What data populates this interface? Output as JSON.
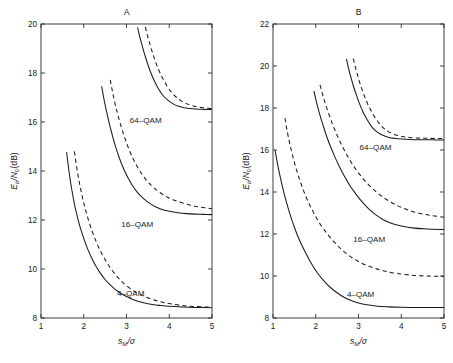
{
  "figure": {
    "width": 453,
    "height": 363,
    "background": "#ffffff",
    "ink_color": "#1a1a1a"
  },
  "chart_data": [
    {
      "type": "line",
      "title": "A",
      "panel_id": "A",
      "xlabel": "s_M/σ",
      "xlabel_parts": {
        "base": "s",
        "sub": "M",
        "tail": "/σ"
      },
      "ylabel": "E_b/N_0(dB)",
      "ylabel_parts": {
        "base1": "E",
        "sub1": "b",
        "mid": "/N",
        "sub2": "0",
        "tail": "(dB)"
      },
      "xlim": [
        1,
        5
      ],
      "ylim": [
        8,
        20
      ],
      "xticks": [
        1,
        2,
        3,
        4,
        5
      ],
      "yticks": [
        8,
        10,
        12,
        14,
        16,
        18,
        20
      ],
      "xticklabels": [
        "1",
        "2",
        "3",
        "4",
        "5"
      ],
      "yticklabels": [
        "8",
        "10",
        "12",
        "14",
        "16",
        "18",
        "20"
      ],
      "grid": false,
      "legend": "inline-annotations",
      "annotations": [
        {
          "text": "64–QAM",
          "x": 3.45,
          "y": 15.95
        },
        {
          "text": "16–QAM",
          "x": 3.25,
          "y": 11.72
        },
        {
          "text": "4–QAM",
          "x": 3.1,
          "y": 8.88
        }
      ],
      "series": [
        {
          "name": "4-QAM exact",
          "style": "solid",
          "asymptote": 8.4,
          "x": [
            1.6,
            1.65,
            1.7,
            1.75,
            1.8,
            1.9,
            2.0,
            2.1,
            2.2,
            2.3,
            2.4,
            2.5,
            2.6,
            2.7,
            2.8,
            2.9,
            3.0,
            3.2,
            3.4,
            3.6,
            3.8,
            4.0,
            4.3,
            4.6,
            5.0
          ],
          "y": [
            14.75,
            14.05,
            13.45,
            12.95,
            12.5,
            11.8,
            11.25,
            10.78,
            10.4,
            10.07,
            9.8,
            9.57,
            9.38,
            9.22,
            9.08,
            8.97,
            8.88,
            8.72,
            8.62,
            8.55,
            8.51,
            8.48,
            8.45,
            8.43,
            8.42
          ]
        },
        {
          "name": "4-QAM bound",
          "style": "dashed",
          "asymptote": 8.42,
          "x": [
            1.78,
            1.84,
            1.9,
            1.96,
            2.02,
            2.1,
            2.2,
            2.3,
            2.4,
            2.5,
            2.6,
            2.7,
            2.8,
            2.9,
            3.0,
            3.2,
            3.4,
            3.6,
            3.8,
            4.0,
            4.3,
            4.6,
            5.0
          ],
          "y": [
            14.8,
            14.1,
            13.5,
            13.0,
            12.56,
            12.06,
            11.52,
            11.08,
            10.7,
            10.38,
            10.1,
            9.86,
            9.65,
            9.47,
            9.32,
            9.07,
            8.89,
            8.76,
            8.66,
            8.59,
            8.51,
            8.47,
            8.44
          ]
        },
        {
          "name": "16-QAM exact",
          "style": "solid",
          "asymptote": 12.2,
          "x": [
            2.42,
            2.46,
            2.5,
            2.55,
            2.6,
            2.68,
            2.76,
            2.85,
            2.95,
            3.05,
            3.15,
            3.25,
            3.35,
            3.45,
            3.55,
            3.7,
            3.85,
            4.0,
            4.2,
            4.4,
            4.6,
            4.8,
            5.0
          ],
          "y": [
            17.45,
            17.05,
            16.7,
            16.3,
            15.92,
            15.38,
            14.9,
            14.45,
            14.02,
            13.67,
            13.38,
            13.14,
            12.95,
            12.8,
            12.67,
            12.52,
            12.42,
            12.36,
            12.3,
            12.26,
            12.24,
            12.23,
            12.22
          ]
        },
        {
          "name": "16-QAM bound",
          "style": "dashed",
          "asymptote": 12.24,
          "x": [
            2.62,
            2.66,
            2.7,
            2.75,
            2.8,
            2.88,
            2.96,
            3.05,
            3.15,
            3.25,
            3.35,
            3.45,
            3.55,
            3.65,
            3.8,
            3.95,
            4.1,
            4.3,
            4.5,
            4.7,
            5.0
          ],
          "y": [
            17.72,
            17.35,
            17.0,
            16.62,
            16.28,
            15.78,
            15.35,
            14.92,
            14.52,
            14.18,
            13.9,
            13.66,
            13.46,
            13.3,
            13.1,
            12.94,
            12.82,
            12.7,
            12.6,
            12.53,
            12.46
          ]
        },
        {
          "name": "64-QAM exact",
          "style": "solid",
          "asymptote": 16.5,
          "x": [
            3.26,
            3.3,
            3.35,
            3.41,
            3.48,
            3.56,
            3.65,
            3.75,
            3.86,
            3.98,
            4.1,
            4.22,
            4.35,
            4.48,
            4.62,
            4.76,
            4.88,
            5.0
          ],
          "y": [
            19.85,
            19.55,
            19.22,
            18.84,
            18.45,
            18.05,
            17.68,
            17.35,
            17.07,
            16.87,
            16.73,
            16.64,
            16.58,
            16.55,
            16.53,
            16.52,
            16.51,
            16.51
          ]
        },
        {
          "name": "64-QAM bound",
          "style": "dashed",
          "asymptote": 16.54,
          "x": [
            3.44,
            3.48,
            3.53,
            3.59,
            3.66,
            3.74,
            3.83,
            3.93,
            4.04,
            4.16,
            4.28,
            4.4,
            4.53,
            4.66,
            4.8,
            4.9,
            5.0
          ],
          "y": [
            19.88,
            19.6,
            19.28,
            18.92,
            18.55,
            18.18,
            17.84,
            17.52,
            17.24,
            17.02,
            16.86,
            16.75,
            16.67,
            16.62,
            16.58,
            16.56,
            16.55
          ]
        }
      ]
    },
    {
      "type": "line",
      "title": "B",
      "panel_id": "B",
      "xlabel": "s_M/σ",
      "xlabel_parts": {
        "base": "s",
        "sub": "M",
        "tail": "/σ"
      },
      "ylabel": "E_b/N_0(dB)",
      "ylabel_parts": {
        "base1": "E",
        "sub1": "b",
        "mid": "/N",
        "sub2": "0",
        "tail": "(dB)"
      },
      "xlim": [
        1,
        5
      ],
      "ylim": [
        8,
        22
      ],
      "xticks": [
        1,
        2,
        3,
        4,
        5
      ],
      "yticks": [
        8,
        10,
        12,
        14,
        16,
        18,
        20,
        22
      ],
      "xticklabels": [
        "1",
        "2",
        "3",
        "4",
        "5"
      ],
      "yticklabels": [
        "8",
        "10",
        "12",
        "14",
        "16",
        "18",
        "20",
        "22"
      ],
      "grid": false,
      "legend": "inline-annotations",
      "annotations": [
        {
          "text": "64–QAM",
          "x": 3.4,
          "y": 16.0
        },
        {
          "text": "16–QAM",
          "x": 3.25,
          "y": 11.62
        },
        {
          "text": "4–QAM",
          "x": 3.05,
          "y": 9.0
        }
      ],
      "series": [
        {
          "name": "4-QAM exact",
          "style": "solid",
          "asymptote": 8.5,
          "x": [
            1.05,
            1.1,
            1.16,
            1.22,
            1.3,
            1.4,
            1.5,
            1.62,
            1.75,
            1.9,
            2.05,
            2.2,
            2.35,
            2.5,
            2.65,
            2.8,
            3.0,
            3.2,
            3.45,
            3.7,
            4.0,
            4.4,
            4.7,
            5.0
          ],
          "y": [
            15.98,
            15.4,
            14.8,
            14.26,
            13.62,
            12.92,
            12.32,
            11.7,
            11.15,
            10.58,
            10.12,
            9.74,
            9.44,
            9.2,
            9.0,
            8.86,
            8.72,
            8.63,
            8.56,
            8.53,
            8.51,
            8.5,
            8.5,
            8.5
          ]
        },
        {
          "name": "4-QAM bound",
          "style": "dashed",
          "asymptote": 8.53,
          "x": [
            1.28,
            1.33,
            1.39,
            1.46,
            1.54,
            1.63,
            1.73,
            1.85,
            1.98,
            2.12,
            2.28,
            2.44,
            2.6,
            2.76,
            2.94,
            3.14,
            3.36,
            3.6,
            3.9,
            4.25,
            4.6,
            5.0
          ],
          "y": [
            17.52,
            16.92,
            16.32,
            15.72,
            15.12,
            14.54,
            13.98,
            13.42,
            12.9,
            12.42,
            11.98,
            11.6,
            11.27,
            11.0,
            10.76,
            10.55,
            10.38,
            10.24,
            10.12,
            10.04,
            10.0,
            9.98
          ]
        },
        {
          "name": "16-QAM exact",
          "style": "solid",
          "asymptote": 12.2,
          "x": [
            1.96,
            2.0,
            2.05,
            2.11,
            2.18,
            2.26,
            2.35,
            2.45,
            2.56,
            2.68,
            2.8,
            2.94,
            3.08,
            3.24,
            3.4,
            3.58,
            3.78,
            4.0,
            4.3,
            4.6,
            5.0
          ],
          "y": [
            18.8,
            18.42,
            18.02,
            17.58,
            17.12,
            16.62,
            16.14,
            15.66,
            15.18,
            14.72,
            14.3,
            13.9,
            13.54,
            13.2,
            12.92,
            12.68,
            12.5,
            12.38,
            12.28,
            12.24,
            12.21
          ]
        },
        {
          "name": "16-QAM bound",
          "style": "dashed",
          "asymptote": 12.25,
          "x": [
            2.1,
            2.15,
            2.21,
            2.28,
            2.36,
            2.45,
            2.55,
            2.66,
            2.78,
            2.91,
            3.05,
            3.2,
            3.36,
            3.53,
            3.72,
            3.92,
            4.14,
            4.4,
            4.7,
            5.0
          ],
          "y": [
            19.1,
            18.72,
            18.3,
            17.86,
            17.4,
            16.94,
            16.48,
            16.02,
            15.58,
            15.16,
            14.78,
            14.42,
            14.1,
            13.82,
            13.56,
            13.34,
            13.16,
            13.0,
            12.88,
            12.8
          ]
        },
        {
          "name": "64-QAM exact",
          "style": "solid",
          "asymptote": 16.5,
          "x": [
            2.72,
            2.76,
            2.81,
            2.87,
            2.94,
            3.02,
            3.11,
            3.21,
            3.32,
            3.44,
            3.57,
            3.71,
            3.86,
            4.02,
            4.2,
            4.4,
            4.62,
            4.82,
            5.0
          ],
          "y": [
            20.32,
            19.95,
            19.55,
            19.12,
            18.68,
            18.22,
            17.8,
            17.42,
            17.08,
            16.85,
            16.7,
            16.6,
            16.55,
            16.52,
            16.5,
            16.49,
            16.49,
            16.48,
            16.48
          ]
        },
        {
          "name": "64-QAM bound",
          "style": "dashed",
          "asymptote": 16.55,
          "x": [
            2.88,
            2.92,
            2.97,
            3.03,
            3.1,
            3.18,
            3.27,
            3.37,
            3.48,
            3.6,
            3.73,
            3.87,
            4.02,
            4.18,
            4.36,
            4.56,
            4.78,
            5.0
          ],
          "y": [
            20.35,
            20.0,
            19.62,
            19.2,
            18.78,
            18.36,
            17.96,
            17.6,
            17.28,
            17.02,
            16.84,
            16.72,
            16.64,
            16.6,
            16.57,
            16.56,
            16.55,
            16.55
          ]
        }
      ]
    }
  ],
  "panels": {
    "left": {
      "title": "A"
    },
    "right": {
      "title": "B"
    }
  }
}
